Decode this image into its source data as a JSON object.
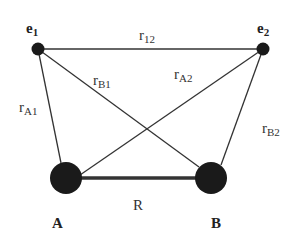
{
  "diagram": {
    "nodes": {
      "e1": {
        "label": "e",
        "sub": "1",
        "x": 38,
        "y": 49,
        "r": 6
      },
      "e2": {
        "label": "e",
        "sub": "2",
        "x": 263,
        "y": 49,
        "r": 6
      },
      "A": {
        "label": "A",
        "x": 66,
        "y": 178,
        "r": 16
      },
      "B": {
        "label": "B",
        "x": 211,
        "y": 178,
        "r": 16
      }
    },
    "edges": {
      "r12": {
        "label": "r",
        "sub": "12",
        "from": "e1",
        "to": "e2"
      },
      "rA1": {
        "label": "r",
        "sub": "A1",
        "from": "A",
        "to": "e1"
      },
      "rB1": {
        "label": "r",
        "sub": "B1",
        "from": "B",
        "to": "e1"
      },
      "rA2": {
        "label": "r",
        "sub": "A2",
        "from": "A",
        "to": "e2"
      },
      "rB2": {
        "label": "r",
        "sub": "B2",
        "from": "B",
        "to": "e2"
      },
      "R": {
        "label": "R",
        "from": "A",
        "to": "B"
      }
    },
    "colors": {
      "node": "#1a1a1a",
      "line": "#333333"
    }
  }
}
